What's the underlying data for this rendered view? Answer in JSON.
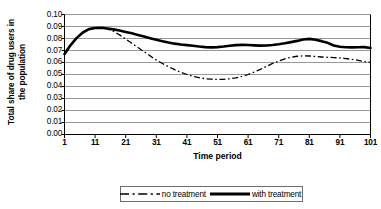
{
  "chart_data": {
    "type": "line",
    "title": "",
    "xlabel": "Time period",
    "ylabel": "Total share of drug users in the population",
    "ylabel_lines": [
      "Total share of drug users in",
      "the population"
    ],
    "xlim": [
      1,
      101
    ],
    "ylim": [
      0.0,
      0.1
    ],
    "grid": true,
    "grid_axis": "y",
    "legend_position": "bottom-center",
    "ytick_labels": [
      "0.10",
      "0.09",
      "0.08",
      "0.07",
      "0.06",
      "0.05",
      "0.04",
      "0.03",
      "0.02",
      "0.01",
      "0.00"
    ],
    "ytick_values": [
      0.1,
      0.09,
      0.08,
      0.07,
      0.06,
      0.05,
      0.04,
      0.03,
      0.02,
      0.01,
      0.0
    ],
    "xtick_labels": [
      "1",
      "11",
      "21",
      "31",
      "41",
      "51",
      "61",
      "71",
      "81",
      "91",
      "101"
    ],
    "xtick_values": [
      1,
      11,
      21,
      31,
      41,
      51,
      61,
      71,
      81,
      91,
      101
    ],
    "x": [
      1,
      3,
      5,
      7,
      9,
      11,
      13,
      15,
      17,
      19,
      21,
      23,
      25,
      27,
      29,
      31,
      33,
      35,
      37,
      39,
      41,
      43,
      45,
      47,
      49,
      51,
      53,
      55,
      57,
      59,
      61,
      63,
      65,
      67,
      69,
      71,
      73,
      75,
      77,
      79,
      81,
      83,
      85,
      87,
      89,
      91,
      93,
      95,
      97,
      99,
      101
    ],
    "series": [
      {
        "name": "no treatment",
        "style": "dash-dot",
        "color": "#000000",
        "width": 1.3,
        "values": [
          0.067,
          0.0745,
          0.0805,
          0.085,
          0.0878,
          0.0888,
          0.0889,
          0.088,
          0.086,
          0.083,
          0.0795,
          0.076,
          0.0725,
          0.069,
          0.0655,
          0.062,
          0.0592,
          0.0565,
          0.054,
          0.0518,
          0.05,
          0.0485,
          0.0473,
          0.0465,
          0.0461,
          0.0459,
          0.046,
          0.0464,
          0.0472,
          0.0484,
          0.05,
          0.052,
          0.0543,
          0.0568,
          0.0592,
          0.0612,
          0.063,
          0.0644,
          0.0652,
          0.0655,
          0.0654,
          0.065,
          0.0646,
          0.0643,
          0.0641,
          0.0638,
          0.0633,
          0.0626,
          0.0618,
          0.0608,
          0.06
        ]
      },
      {
        "name": "with treatment",
        "style": "solid",
        "color": "#000000",
        "width": 2.6,
        "values": [
          0.067,
          0.0745,
          0.0805,
          0.085,
          0.0878,
          0.0888,
          0.0889,
          0.0884,
          0.0876,
          0.0866,
          0.0855,
          0.0843,
          0.083,
          0.0816,
          0.0802,
          0.0789,
          0.0777,
          0.0766,
          0.0757,
          0.075,
          0.0745,
          0.074,
          0.0733,
          0.0728,
          0.0726,
          0.0728,
          0.0733,
          0.074,
          0.0745,
          0.0747,
          0.0746,
          0.0743,
          0.0741,
          0.0742,
          0.0746,
          0.0752,
          0.076,
          0.077,
          0.078,
          0.0792,
          0.0797,
          0.079,
          0.0778,
          0.0764,
          0.0742,
          0.0731,
          0.0727,
          0.0726,
          0.0727,
          0.0728,
          0.0721
        ]
      }
    ],
    "legend": [
      {
        "label": "no treatment",
        "style": "dash-dot"
      },
      {
        "label": "with treatment",
        "style": "solid"
      }
    ]
  }
}
